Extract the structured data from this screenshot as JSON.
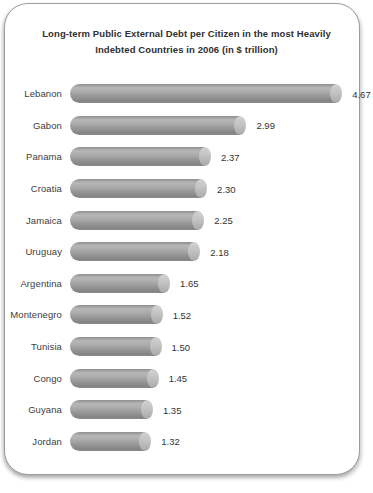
{
  "chart_data": {
    "type": "bar",
    "orientation": "horizontal",
    "title": "Long-term Public External Debt per Citizen in the most Heavily Indebted Countries in 2006 (in $ trillion)",
    "categories": [
      "Lebanon",
      "Gabon",
      "Panama",
      "Croatia",
      "Jamaica",
      "Uruguay",
      "Argentina",
      "Montenegro",
      "Tunisia",
      "Congo",
      "Guyana",
      "Jordan"
    ],
    "values": [
      4.67,
      2.99,
      2.37,
      2.3,
      2.25,
      2.18,
      1.65,
      1.52,
      1.5,
      1.45,
      1.35,
      1.32
    ],
    "value_decimals": 2,
    "xlim": [
      0,
      5
    ],
    "grid": false,
    "legend": false,
    "bar_style": "3d-cylinder",
    "bar_color": "#9a9a9a",
    "bar_cap_color": "#c6c6c6",
    "frame_border_color": "#9c9c9c",
    "background_color": "#ffffff",
    "text_color": "#333333"
  }
}
